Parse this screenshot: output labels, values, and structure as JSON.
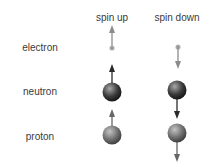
{
  "columns": [
    {
      "id": "spin-up",
      "label": "spin up",
      "x": 112
    },
    {
      "id": "spin-down",
      "label": "spin down",
      "x": 177
    }
  ],
  "rows": [
    {
      "id": "electron",
      "label": "electron",
      "y": 48
    },
    {
      "id": "neutron",
      "label": "neutron",
      "y": 92
    },
    {
      "id": "proton",
      "label": "proton",
      "y": 136
    }
  ],
  "particles": {
    "electron": {
      "kind": "dot",
      "radius": 2.5,
      "color": "#9a9a9a",
      "arrow_color": "#8c8c8c"
    },
    "neutron": {
      "kind": "ball",
      "radius": 9.5,
      "color_light": "#9a9a9a",
      "color_dark": "#111111",
      "arrow_color": "#2a2a2a"
    },
    "proton": {
      "kind": "ball",
      "radius": 9.5,
      "color_light": "#b5b5b5",
      "color_dark": "#3a3a3a",
      "arrow_color": "#666666"
    }
  },
  "colors": {
    "background": "#ffffff",
    "text": "#3a3a3a"
  }
}
